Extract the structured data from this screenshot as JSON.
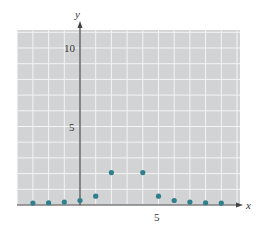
{
  "chart_data": {
    "type": "scatter",
    "title": "",
    "xlabel": "x",
    "ylabel": "y",
    "xlim": [
      -4,
      10
    ],
    "ylim": [
      0,
      11
    ],
    "grid": true,
    "x_ticks_labeled": [
      5
    ],
    "y_ticks_labeled": [
      5,
      10
    ],
    "x": [
      -3,
      -2,
      -1,
      0,
      1,
      2,
      4,
      5,
      6,
      7,
      8,
      9
    ],
    "y": [
      0.056,
      0.08,
      0.125,
      0.22,
      0.5,
      2.0,
      2.0,
      0.5,
      0.22,
      0.125,
      0.08,
      0.056
    ],
    "series": [
      {
        "name": "points",
        "points": [
          {
            "x": -3,
            "y": 0.056
          },
          {
            "x": -2,
            "y": 0.08
          },
          {
            "x": -1,
            "y": 0.125
          },
          {
            "x": 0,
            "y": 0.22
          },
          {
            "x": 1,
            "y": 0.5
          },
          {
            "x": 2,
            "y": 2.0
          },
          {
            "x": 4,
            "y": 2.0
          },
          {
            "x": 5,
            "y": 0.5
          },
          {
            "x": 6,
            "y": 0.22
          },
          {
            "x": 7,
            "y": 0.125
          },
          {
            "x": 8,
            "y": 0.08
          },
          {
            "x": 9,
            "y": 0.056
          }
        ]
      }
    ]
  },
  "colors": {
    "grid_background": "#d2d3d5",
    "grid_line": "#f4f4f5",
    "axis": "#444444",
    "point": "#2f7f8c"
  },
  "labels": {
    "x_axis": "x",
    "y_axis": "y",
    "x_tick_5": "5",
    "y_tick_5": "5",
    "y_tick_10": "10"
  }
}
